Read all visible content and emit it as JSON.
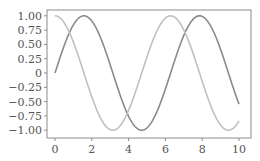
{
  "chart_data": {
    "type": "line",
    "title": "",
    "xlabel": "",
    "ylabel": "",
    "xlim": [
      -0.5,
      10.5
    ],
    "ylim": [
      -1.1,
      1.1
    ],
    "grid": false,
    "legend": null,
    "x_ticks": [
      0,
      2,
      4,
      6,
      8,
      10
    ],
    "x_tick_labels": [
      "0",
      "2",
      "4",
      "6",
      "8",
      "10"
    ],
    "y_ticks": [
      1.0,
      0.75,
      0.5,
      0.25,
      0,
      -0.25,
      -0.5,
      -0.75,
      -1.0
    ],
    "y_tick_labels": [
      "1.00",
      "0.75",
      "0.50",
      "0.25",
      "0",
      "−0.25",
      "−0.50",
      "−0.75",
      "−1.00"
    ],
    "series": [
      {
        "name": "sin(x)",
        "color": "#8a8a8a",
        "x": [
          0,
          0.5,
          1,
          1.5,
          1.5708,
          2,
          2.5,
          3,
          3.5,
          4,
          4.5,
          4.7124,
          5,
          5.5,
          6,
          6.5,
          7,
          7.5,
          7.854,
          8,
          8.5,
          9,
          9.5,
          10
        ],
        "values": [
          0,
          0.479,
          0.841,
          0.997,
          1.0,
          0.909,
          0.598,
          0.141,
          -0.351,
          -0.757,
          -0.978,
          -1.0,
          -0.959,
          -0.706,
          -0.279,
          0.215,
          0.657,
          0.938,
          1.0,
          0.989,
          0.798,
          0.412,
          -0.075,
          -0.544
        ]
      },
      {
        "name": "cos(x)",
        "color": "#c0c0c0",
        "x": [
          0,
          0.5,
          1,
          1.5,
          2,
          2.5,
          3,
          3.1416,
          3.5,
          4,
          4.5,
          5,
          5.5,
          6,
          6.2832,
          6.5,
          7,
          7.5,
          8,
          8.5,
          9,
          9.4248,
          9.5,
          10
        ],
        "values": [
          1.0,
          0.878,
          0.54,
          0.071,
          -0.416,
          -0.801,
          -0.99,
          -1.0,
          -0.936,
          -0.654,
          -0.211,
          0.284,
          0.709,
          0.96,
          1.0,
          0.977,
          0.754,
          0.347,
          -0.146,
          -0.602,
          -0.911,
          -1.0,
          -0.997,
          -0.839
        ]
      }
    ]
  },
  "style": {
    "frame_color": "#8c8c8c",
    "tick_color": "#8c8c8c",
    "label_color": "#555555"
  }
}
